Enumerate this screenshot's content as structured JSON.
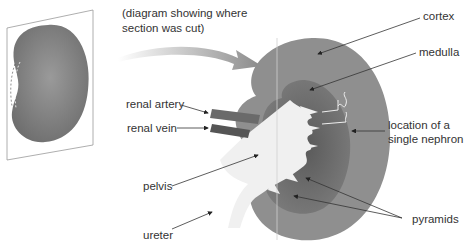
{
  "caption": {
    "line1": "(diagram showing where",
    "line2": "section was cut)"
  },
  "labels": {
    "cortex": "cortex",
    "medulla": "medulla",
    "renal_artery": "renal artery",
    "renal_vein": "renal vein",
    "nephron_line1": "location of a",
    "nephron_line2": "single nephron",
    "pelvis": "pelvis",
    "ureter": "ureter",
    "pyramids": "pyramids"
  },
  "colors": {
    "cortex": "#8f8f8f",
    "medulla": "#6e6e6e",
    "pelvis": "#f0f0f0",
    "whole_kidney": "#7a7a7a",
    "artery": "#6a6a6a",
    "vein": "#555555",
    "text": "#333333"
  }
}
